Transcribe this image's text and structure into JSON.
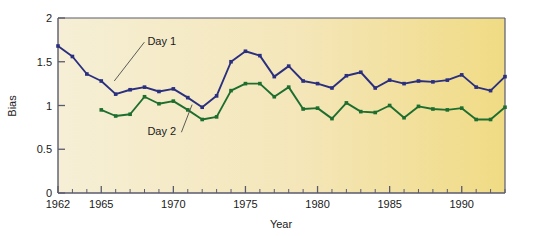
{
  "chart_data": {
    "type": "line",
    "title": "",
    "xlabel": "Year",
    "ylabel": "Bias",
    "xlim": [
      1962,
      1993
    ],
    "ylim": [
      0,
      2
    ],
    "grid": false,
    "legend_position": "inline-annotations",
    "y_ticks": [
      0,
      0.5,
      1,
      1.5,
      2
    ],
    "y_tick_labels": [
      "0",
      "0.5",
      "1",
      "1.5",
      "2"
    ],
    "x_major_ticks": [
      1962,
      1965,
      1970,
      1975,
      1980,
      1985,
      1990
    ],
    "x_major_tick_labels": [
      "1962",
      "1965",
      "1970",
      "1975",
      "1980",
      "1985",
      "1990"
    ],
    "x_minor_tick_step": 1,
    "background_gradient_from": "#f6efd6",
    "background_gradient_to": "#f0db84",
    "series": [
      {
        "name": "Day 1",
        "color": "#2b2f80",
        "marker": "square",
        "x": [
          1962,
          1963,
          1964,
          1965,
          1966,
          1967,
          1968,
          1969,
          1970,
          1971,
          1972,
          1973,
          1974,
          1975,
          1976,
          1977,
          1978,
          1979,
          1980,
          1981,
          1982,
          1983,
          1984,
          1985,
          1986,
          1987,
          1988,
          1989,
          1990,
          1991,
          1992,
          1993
        ],
        "values": [
          1.68,
          1.56,
          1.36,
          1.28,
          1.13,
          1.18,
          1.21,
          1.16,
          1.19,
          1.09,
          0.98,
          1.11,
          1.5,
          1.62,
          1.57,
          1.33,
          1.45,
          1.28,
          1.25,
          1.2,
          1.34,
          1.38,
          1.2,
          1.29,
          1.25,
          1.28,
          1.27,
          1.29,
          1.35,
          1.21,
          1.17,
          1.33
        ]
      },
      {
        "name": "Day 2",
        "color": "#1d6e2f",
        "marker": "square",
        "x": [
          1965,
          1966,
          1967,
          1968,
          1969,
          1970,
          1971,
          1972,
          1973,
          1974,
          1975,
          1976,
          1977,
          1978,
          1979,
          1980,
          1981,
          1982,
          1983,
          1984,
          1985,
          1986,
          1987,
          1988,
          1989,
          1990,
          1991,
          1992,
          1993
        ],
        "values": [
          0.95,
          0.88,
          0.9,
          1.1,
          1.02,
          1.05,
          0.95,
          0.84,
          0.87,
          1.17,
          1.25,
          1.25,
          1.1,
          1.21,
          0.96,
          0.97,
          0.85,
          1.03,
          0.93,
          0.92,
          1.0,
          0.86,
          0.99,
          0.96,
          0.95,
          0.97,
          0.84,
          0.84,
          0.98
        ]
      }
    ],
    "annotations": [
      {
        "text": "Day 1",
        "label_x": 1968.2,
        "label_y": 1.69,
        "leader_to_x": 1965.9,
        "leader_to_y": 1.28
      },
      {
        "text": "Day 2",
        "label_x": 1968.2,
        "label_y": 0.66,
        "leader_to_x": 1971.3,
        "leader_to_y": 1.01
      }
    ]
  },
  "axes": {
    "y_title": "Bias",
    "x_title": "Year"
  }
}
